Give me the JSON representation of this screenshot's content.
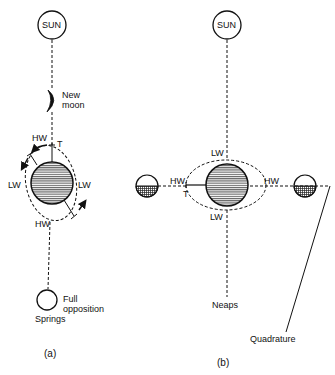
{
  "panel_a": {
    "caption": "(a)",
    "sun_label": "SUN",
    "new_moon_label_1": "New",
    "new_moon_label_2": "moon",
    "hw_top": "HW",
    "hw_bottom": "HW",
    "lw_left": "LW",
    "lw_right": "LW",
    "tide_marker": "T",
    "full_label_1": "Full",
    "full_label_2": "opposition",
    "springs_label": "Springs"
  },
  "panel_b": {
    "caption": "(b)",
    "sun_label": "SUN",
    "lw_top": "LW",
    "lw_bottom": "LW",
    "hw_left": "HW",
    "hw_right": "HW",
    "tide_marker": "T",
    "neaps_label": "Neaps",
    "quadrature_label": "Quadrature"
  },
  "colors": {
    "ink": "#111111",
    "background": "#ffffff"
  }
}
